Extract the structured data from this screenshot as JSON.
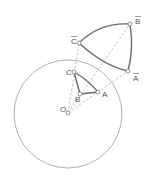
{
  "diagram": {
    "circle": {
      "cx": 68,
      "cy": 114,
      "r": 54,
      "color": "#9a9a9a"
    },
    "center": {
      "label": "O",
      "x": 68,
      "y": 113,
      "lx": 60,
      "ly": 112
    },
    "points": [
      {
        "id": "A",
        "label": "A",
        "x": 98,
        "y": 92,
        "lx": 102,
        "ly": 97
      },
      {
        "id": "B",
        "label": "B",
        "x": 80,
        "y": 94,
        "lx": 75,
        "ly": 102
      },
      {
        "id": "C",
        "label": "C",
        "x": 74,
        "y": 72,
        "lx": 66,
        "ly": 74
      }
    ],
    "image_points": [
      {
        "id": "A_bar",
        "label": "A",
        "x": 128,
        "y": 71,
        "lx": 133,
        "ly": 80
      },
      {
        "id": "B_bar",
        "label": "B",
        "x": 130,
        "y": 24,
        "lx": 136,
        "ly": 23
      },
      {
        "id": "C_bar",
        "label": "C",
        "x": 79,
        "y": 43,
        "lx": 71,
        "ly": 43
      }
    ],
    "colors": {
      "thin": "#9a9a9a",
      "thick": "#6a6a6a",
      "dashed": "#a8a8a8",
      "label": "#555555"
    }
  }
}
